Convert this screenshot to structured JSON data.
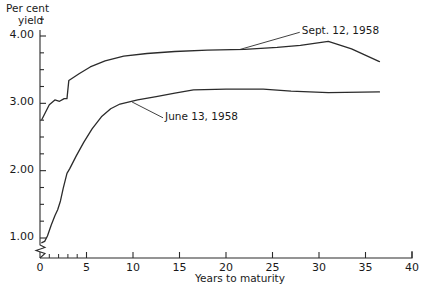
{
  "chart_data": {
    "type": "line",
    "title": "",
    "ylabel": "Per cent yield",
    "ylabel_line1": "Per cent",
    "ylabel_line2": "yield",
    "xlabel": "Years to maturity",
    "xlim": [
      0,
      40
    ],
    "ylim": [
      0.78,
      4.3
    ],
    "y_axis_break": true,
    "y_break_note": "axis broken below 1.00",
    "grid": false,
    "legend_position": "inline-annotations",
    "ytick_labels": [
      "1.00",
      "2.00",
      "3.00",
      "4.00"
    ],
    "ytick_values": [
      1.0,
      2.0,
      3.0,
      4.0
    ],
    "yminor_step": 0.25,
    "xtick_labels": [
      "0",
      "5",
      "10",
      "15",
      "20",
      "25",
      "30",
      "35",
      "40"
    ],
    "xtick_values": [
      0,
      5,
      10,
      15,
      20,
      25,
      30,
      35,
      40
    ],
    "xminor_values": [
      1,
      2,
      3,
      4
    ],
    "series": [
      {
        "name": "Sept. 12, 1958",
        "label": "Sept. 12, 1958",
        "color": "#2b2b2b",
        "annotation_x": 27.5,
        "annotation_y": 4.07,
        "points": [
          {
            "x": 0.2,
            "y": 2.76
          },
          {
            "x": 1.0,
            "y": 2.98
          },
          {
            "x": 1.6,
            "y": 3.05
          },
          {
            "x": 2.1,
            "y": 3.03
          },
          {
            "x": 2.6,
            "y": 3.07
          },
          {
            "x": 2.9,
            "y": 3.07
          },
          {
            "x": 3.1,
            "y": 3.34
          },
          {
            "x": 4.2,
            "y": 3.44
          },
          {
            "x": 5.4,
            "y": 3.54
          },
          {
            "x": 7.0,
            "y": 3.63
          },
          {
            "x": 9.0,
            "y": 3.7
          },
          {
            "x": 11.5,
            "y": 3.74
          },
          {
            "x": 14.5,
            "y": 3.77
          },
          {
            "x": 18.0,
            "y": 3.79
          },
          {
            "x": 22.0,
            "y": 3.8
          },
          {
            "x": 25.5,
            "y": 3.83
          },
          {
            "x": 28.0,
            "y": 3.86
          },
          {
            "x": 31.0,
            "y": 3.92
          },
          {
            "x": 33.5,
            "y": 3.81
          },
          {
            "x": 36.5,
            "y": 3.62
          }
        ]
      },
      {
        "name": "June 13, 1958",
        "label": "June 13, 1958",
        "color": "#2b2b2b",
        "annotation_x": 12.8,
        "annotation_y": 2.8,
        "points": [
          {
            "x": 0.2,
            "y": 0.93
          },
          {
            "x": 0.5,
            "y": 0.95
          },
          {
            "x": 0.8,
            "y": 1.03
          },
          {
            "x": 1.2,
            "y": 1.19
          },
          {
            "x": 1.6,
            "y": 1.33
          },
          {
            "x": 1.9,
            "y": 1.42
          },
          {
            "x": 2.2,
            "y": 1.55
          },
          {
            "x": 2.5,
            "y": 1.74
          },
          {
            "x": 2.9,
            "y": 1.96
          },
          {
            "x": 3.2,
            "y": 2.03
          },
          {
            "x": 3.9,
            "y": 2.22
          },
          {
            "x": 4.7,
            "y": 2.42
          },
          {
            "x": 5.6,
            "y": 2.62
          },
          {
            "x": 6.6,
            "y": 2.8
          },
          {
            "x": 7.6,
            "y": 2.92
          },
          {
            "x": 8.6,
            "y": 2.99
          },
          {
            "x": 10.5,
            "y": 3.05
          },
          {
            "x": 12.5,
            "y": 3.1
          },
          {
            "x": 14.5,
            "y": 3.15
          },
          {
            "x": 16.5,
            "y": 3.2
          },
          {
            "x": 20.0,
            "y": 3.21
          },
          {
            "x": 24.0,
            "y": 3.21
          },
          {
            "x": 27.0,
            "y": 3.18
          },
          {
            "x": 31.0,
            "y": 3.16
          },
          {
            "x": 36.5,
            "y": 3.17
          }
        ]
      }
    ]
  }
}
